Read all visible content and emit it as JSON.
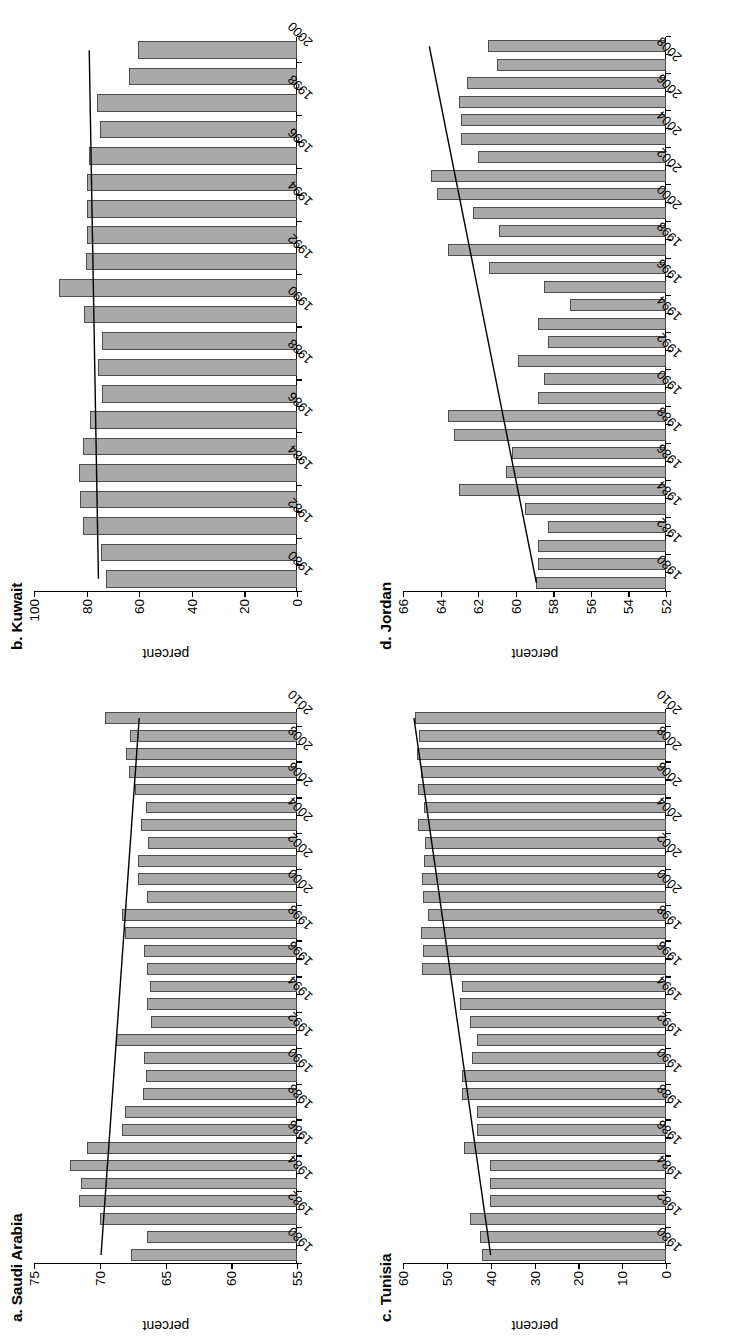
{
  "figure": {
    "orientation": "rotated-90-ccw",
    "panel_count": 4,
    "bar_color": "#a9a9a9",
    "bar_border_color": "#4d4d4d",
    "trend_color": "#000000"
  },
  "chart_data": [
    {
      "id": "saudi",
      "type": "bar",
      "title": "a. Saudi Arabia",
      "xlabel": "",
      "ylabel": "percent",
      "ylim": [
        55,
        75
      ],
      "yticks": [
        55,
        60,
        65,
        70,
        75
      ],
      "ytick_labels": [
        "55",
        "60",
        "65",
        "70",
        "75"
      ],
      "grid": false,
      "legend": "none",
      "xtick_labels": [
        "1980",
        "1982",
        "1984",
        "1986",
        "1988",
        "1990",
        "1992",
        "1994",
        "1996",
        "1998",
        "2000",
        "2002",
        "2004",
        "2006",
        "2008",
        "2010"
      ],
      "categories": [
        "1980",
        "1981",
        "1982",
        "1983",
        "1984",
        "1985",
        "1986",
        "1987",
        "1988",
        "1989",
        "1990",
        "1991",
        "1992",
        "1993",
        "1994",
        "1995",
        "1996",
        "1997",
        "1998",
        "1999",
        "2000",
        "2001",
        "2002",
        "2003",
        "2004",
        "2005",
        "2006",
        "2007",
        "2008",
        "2009",
        "2010"
      ],
      "values": [
        67.6,
        66.4,
        70.0,
        71.6,
        71.4,
        72.3,
        71.0,
        68.3,
        68.1,
        66.7,
        66.5,
        66.6,
        68.8,
        66.1,
        66.4,
        66.2,
        66.4,
        66.6,
        68.1,
        68.3,
        66.4,
        67.1,
        67.1,
        66.3,
        66.9,
        66.5,
        67.3,
        67.8,
        68.0,
        67.7,
        69.6
      ],
      "trendline": {
        "start_value": 69.9,
        "end_value": 67.0
      }
    },
    {
      "id": "kuwait",
      "type": "bar",
      "title": "b. Kuwait",
      "xlabel": "",
      "ylabel": "percent",
      "ylim": [
        0,
        100
      ],
      "yticks": [
        0,
        20,
        40,
        60,
        80,
        100
      ],
      "ytick_labels": [
        "0",
        "20",
        "40",
        "60",
        "80",
        "100"
      ],
      "grid": false,
      "legend": "none",
      "xtick_labels": [
        "1980",
        "1982",
        "1984",
        "1986",
        "1988",
        "1990",
        "1992",
        "1994",
        "1996",
        "1998",
        "2000"
      ],
      "categories": [
        "1980",
        "1981",
        "1982",
        "1983",
        "1984",
        "1985",
        "1986",
        "1987",
        "1988",
        "1989",
        "1990",
        "1991",
        "1992",
        "1993",
        "1994",
        "1995",
        "1996",
        "1997",
        "1998",
        "1999",
        "2000"
      ],
      "values": [
        72.5,
        74.4,
        81.5,
        82.5,
        83.0,
        81.2,
        78.6,
        74.0,
        75.5,
        74.3,
        80.8,
        90.5,
        80.2,
        79.7,
        80.0,
        79.8,
        79.0,
        74.9,
        76.0,
        63.8,
        60.5
      ],
      "trendline": {
        "start_value": 75.5,
        "end_value": 79.0
      }
    },
    {
      "id": "tunisia",
      "type": "bar",
      "title": "c. Tunisia",
      "xlabel": "",
      "ylabel": "percent",
      "ylim": [
        0,
        60
      ],
      "yticks": [
        0,
        10,
        20,
        30,
        40,
        50,
        60
      ],
      "ytick_labels": [
        "0",
        "10",
        "20",
        "30",
        "40",
        "50",
        "60"
      ],
      "grid": false,
      "legend": "none",
      "xtick_labels": [
        "1980",
        "1982",
        "1984",
        "1986",
        "1988",
        "1990",
        "1992",
        "1994",
        "1996",
        "1998",
        "2000",
        "2002",
        "2004",
        "2006",
        "2008",
        "2010"
      ],
      "categories": [
        "1980",
        "1981",
        "1982",
        "1983",
        "1984",
        "1985",
        "1986",
        "1987",
        "1988",
        "1989",
        "1990",
        "1991",
        "1992",
        "1993",
        "1994",
        "1995",
        "1996",
        "1997",
        "1998",
        "1999",
        "2000",
        "2001",
        "2002",
        "2003",
        "2004",
        "2005",
        "2006",
        "2007",
        "2008",
        "2009",
        "2010"
      ],
      "values": [
        42.0,
        42.5,
        44.8,
        40.2,
        40.2,
        40.1,
        46.0,
        43.2,
        43.1,
        46.5,
        46.6,
        44.3,
        43.1,
        44.8,
        46.9,
        46.6,
        55.6,
        55.4,
        55.8,
        54.3,
        55.5,
        55.6,
        55.3,
        54.9,
        56.5,
        55.1,
        56.6,
        55.8,
        56.8,
        56.3,
        57.2
      ],
      "trendline": {
        "start_value": 40.0,
        "end_value": 57.5
      }
    },
    {
      "id": "jordan",
      "type": "bar",
      "title": "d. Jordan",
      "xlabel": "",
      "ylabel": "percent",
      "ylim": [
        52,
        66
      ],
      "yticks": [
        52,
        54,
        56,
        58,
        60,
        62,
        64,
        66
      ],
      "ytick_labels": [
        "52",
        "54",
        "56",
        "58",
        "60",
        "62",
        "64",
        "66"
      ],
      "grid": false,
      "legend": "none",
      "xtick_labels": [
        "1980",
        "1982",
        "1984",
        "1986",
        "1988",
        "1990",
        "1992",
        "1994",
        "1996",
        "1998",
        "2000",
        "2002",
        "2004",
        "2006",
        "2008"
      ],
      "categories": [
        "1980",
        "1981",
        "1982",
        "1983",
        "1984",
        "1985",
        "1986",
        "1987",
        "1988",
        "1989",
        "1990",
        "1991",
        "1992",
        "1993",
        "1994",
        "1995",
        "1996",
        "1997",
        "1998",
        "1999",
        "2000",
        "2001",
        "2002",
        "2003",
        "2004",
        "2005",
        "2006",
        "2007",
        "2008",
        "2009"
      ],
      "values": [
        58.9,
        58.8,
        58.8,
        58.3,
        59.5,
        63.0,
        60.5,
        60.2,
        63.3,
        63.6,
        58.8,
        58.5,
        59.9,
        58.3,
        58.8,
        57.1,
        58.5,
        61.4,
        63.6,
        60.9,
        62.3,
        64.2,
        64.5,
        62.0,
        62.9,
        62.9,
        63.0,
        62.6,
        61.0,
        61.5
      ],
      "trendline": {
        "start_value": 58.9,
        "end_value": 64.6
      }
    }
  ]
}
